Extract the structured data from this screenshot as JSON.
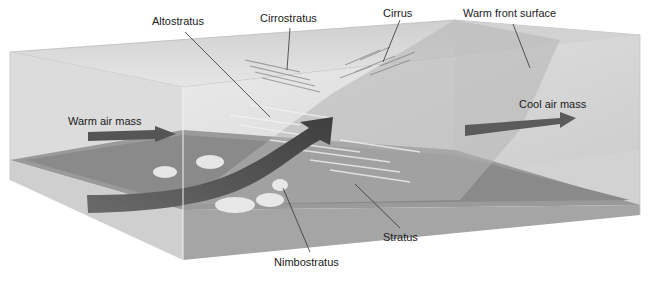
{
  "diagram": {
    "labels": {
      "altostratus": "Altostratus",
      "cirrostratus": "Cirrostratus",
      "cirrus": "Cirrus",
      "warm_front_surface": "Warm front surface",
      "warm_air_mass": "Warm air mass",
      "cool_air_mass": "Cool air mass",
      "stratus": "Stratus",
      "nimbostratus": "Nimbostratus"
    },
    "colors": {
      "box_face": "#d9d9d9",
      "ground": "#8f8f8f",
      "front_surface": "#bdbdbd",
      "arrow": "#5a5a5a",
      "leader_line": "#333333"
    }
  }
}
